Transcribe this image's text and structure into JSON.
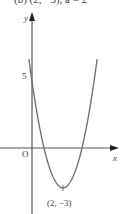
{
  "header": {
    "cut_text": "(b)  (2, −3), a = 2"
  },
  "chart_data": {
    "type": "line",
    "title": "",
    "xlabel": "x",
    "ylabel": "y",
    "origin_label": "O",
    "function": "y = 2(x - 2)^2 - 3",
    "y_intercept_label": "5",
    "vertex": {
      "x": 2,
      "y": -3,
      "label": "(2, −3)"
    },
    "x": [
      -0.2,
      0,
      0.5,
      1,
      1.5,
      2,
      2.5,
      3,
      3.5,
      4,
      4.2
    ],
    "values": [
      6.68,
      5,
      1.5,
      -1,
      -2.5,
      -3,
      -2.5,
      -1,
      1.5,
      5,
      6.68
    ],
    "grid": false,
    "legend": null
  },
  "style": {
    "curve_color": "#6b6b6b",
    "axis_color": "#555555"
  }
}
